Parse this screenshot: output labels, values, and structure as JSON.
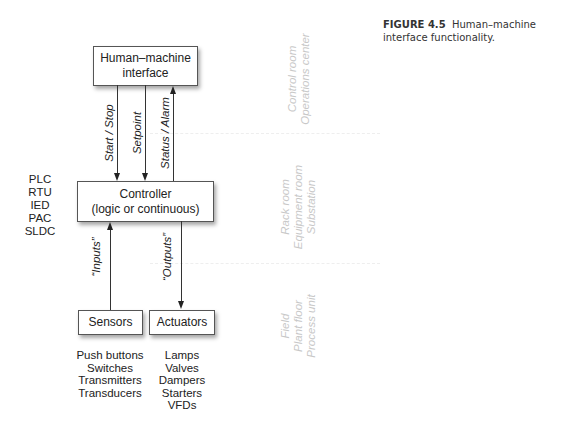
{
  "caption": {
    "label": "FIGURE 4.5",
    "text": "Human–machine interface functionality."
  },
  "boxes": {
    "hmi": {
      "line1": "Human–machine",
      "line2": "interface"
    },
    "controller": {
      "line1": "Controller",
      "line2": "(logic or continuous)"
    },
    "sensors": {
      "label": "Sensors"
    },
    "actuators": {
      "label": "Actuators"
    }
  },
  "signals": {
    "start_stop": "Start / Stop",
    "setpoint": "Setpoint",
    "status_alarm": "Status / Alarm",
    "inputs": "“Inputs”",
    "outputs": "“Outputs”"
  },
  "controller_types": [
    "PLC",
    "RTU",
    "IED",
    "PAC",
    "SLDC"
  ],
  "sensor_examples": [
    "Push buttons",
    "Switches",
    "Transmitters",
    "Transducers"
  ],
  "actuator_examples": [
    "Lamps",
    "Valves",
    "Dampers",
    "Starters",
    "VFDs"
  ],
  "zones": {
    "control": {
      "line1": "Control room",
      "line2": "Operations center"
    },
    "rack": {
      "line1": "Rack room",
      "line2": "Equipment room",
      "line3": "Substation"
    },
    "field": {
      "line1": "Field",
      "line2": "Plant floor",
      "line3": "Process unit"
    }
  }
}
